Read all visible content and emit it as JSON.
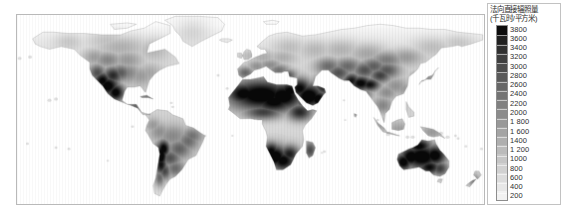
{
  "figure": {
    "type": "choropleth-raster-world-map",
    "background_color": "#ffffff"
  },
  "map": {
    "name": "world-dni-map",
    "projection_note": "equirectangular world raster",
    "frame_color": "#b9b9b9",
    "ocean_color": "#ffffff",
    "colormap": "grayscale-inverted-dark-high"
  },
  "legend": {
    "title_line_1": "法向直接辐照量",
    "title_line_2": "(千瓦时/平方米)",
    "frame_color": "#c2c2c2",
    "bar_min_color": "#f2f2f2",
    "bar_max_color": "#0d0d0d",
    "ticks": [
      "3800",
      "3600",
      "3400",
      "3200",
      "3000",
      "2800",
      "2600",
      "2400",
      "2200",
      "2000",
      "1 800",
      "1 600",
      "1400",
      "1 200",
      "1000",
      "800",
      "600",
      "400",
      "200"
    ]
  },
  "chart_data": {
    "type": "heatmap",
    "title": "法向直接辐照量 (千瓦时/平方米)",
    "xlabel": "",
    "ylabel": "",
    "unit": "kWh/m²",
    "value_range": [
      200,
      3800
    ],
    "legend_position": "right",
    "grid": false,
    "categories": [
      "3800",
      "3600",
      "3400",
      "3200",
      "3000",
      "2800",
      "2600",
      "2400",
      "2200",
      "2000",
      "1 800",
      "1 600",
      "1400",
      "1 200",
      "1000",
      "800",
      "600",
      "400",
      "200"
    ],
    "values": [
      3800,
      3600,
      3400,
      3200,
      3000,
      2800,
      2600,
      2400,
      2200,
      2000,
      1800,
      1600,
      1400,
      1200,
      1000,
      800,
      600,
      400,
      200
    ],
    "regions": [
      {
        "name": "Australia interior",
        "value": 3400
      },
      {
        "name": "Sahara / North Africa",
        "value": 3200
      },
      {
        "name": "Arabian Peninsula",
        "value": 3200
      },
      {
        "name": "Atacama / Andes (Chile)",
        "value": 3400
      },
      {
        "name": "Southwest USA / Mexico",
        "value": 3000
      },
      {
        "name": "Tibetan Plateau",
        "value": 2800
      },
      {
        "name": "Southern Africa / Namibia",
        "value": 3000
      },
      {
        "name": "Central Asia",
        "value": 1800
      },
      {
        "name": "Europe",
        "value": 1200
      },
      {
        "name": "Amazon Basin",
        "value": 1200
      },
      {
        "name": "Eastern China",
        "value": 1000
      },
      {
        "name": "Northern Canada / Siberia",
        "value": 800
      }
    ]
  }
}
